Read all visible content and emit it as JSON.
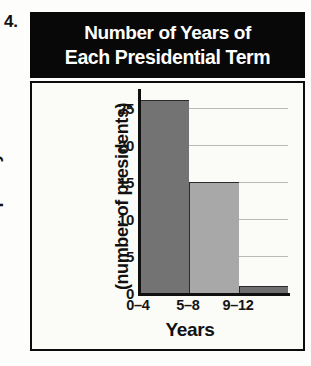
{
  "problem": {
    "number": "4."
  },
  "title": {
    "line1": "Number of Years of",
    "line2": "Each Presidential Term"
  },
  "chart_data": {
    "type": "bar",
    "title": "Number of Years of Each Presidential Term",
    "categories": [
      "0–4",
      "5–8",
      "9–12"
    ],
    "values": [
      26,
      15,
      1
    ],
    "series": [
      {
        "name": "Frequency",
        "values": [
          26,
          15,
          1
        ]
      }
    ],
    "bar_colors": [
      "#737373",
      "#a8a8a8",
      "#6e6e6e"
    ],
    "xlabel": "Years",
    "ylabel": "Frequency (number of presidents)",
    "ylabel_line1": "Frequency",
    "ylabel_line2": "(number of presidents)",
    "ylim": [
      0,
      27
    ],
    "yticks": [
      0,
      5,
      10,
      15,
      20,
      25
    ],
    "ytick_labels": [
      "0",
      "5",
      "10",
      "15",
      "20",
      "25"
    ],
    "grid": true,
    "grid_axis": "y",
    "legend": false,
    "contiguous_bars": true
  },
  "colors": {
    "banner_background": "#080808",
    "banner_text": "#ffffff",
    "frame_border": "#0c0c0c",
    "plot_background": "#fbfbf8",
    "gridline": "#b9b9b9",
    "axis": "#101010",
    "bar_dark": "#737373",
    "bar_light": "#a8a8a8"
  }
}
